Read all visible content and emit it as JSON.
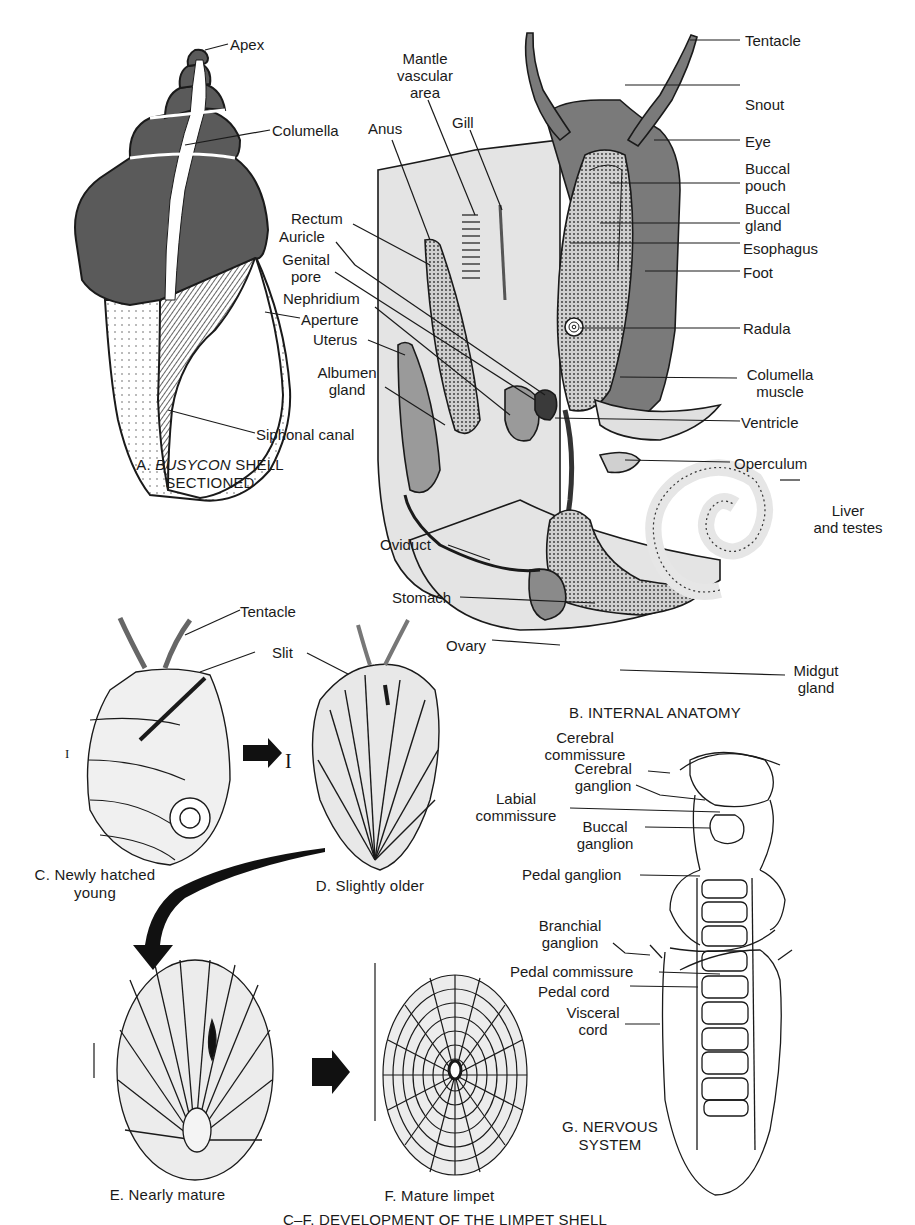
{
  "figure": {
    "colors": {
      "background": "#ffffff",
      "ink": "#1a1a1a",
      "dark_tissue": "#6b6b6b",
      "mid_tissue": "#9a9a9a",
      "light_tissue": "#d8d8d8",
      "mantle": "#e4e4e4"
    },
    "panel_a": {
      "caption_prefix": "A.",
      "caption_italic": "BUSYCON",
      "caption_suffix": "SHELL",
      "caption_line2": "SECTIONED",
      "labels": {
        "apex": "Apex",
        "columella": "Columella",
        "aperture": "Aperture",
        "siphonal_canal": "Siphonal canal"
      }
    },
    "panel_b": {
      "caption": "B. INTERNAL ANATOMY",
      "labels": {
        "mantle_vascular_area_1": "Mantle",
        "mantle_vascular_area_2": "vascular",
        "mantle_vascular_area_3": "area",
        "gill": "Gill",
        "anus": "Anus",
        "rectum": "Rectum",
        "auricle": "Auricle",
        "genital_pore_1": "Genital",
        "genital_pore_2": "pore",
        "nephridium": "Nephridium",
        "uterus": "Uterus",
        "albumen_gland_1": "Albumen",
        "albumen_gland_2": "gland",
        "oviduct": "Oviduct",
        "stomach": "Stomach",
        "ovary": "Ovary",
        "tentacle": "Tentacle",
        "snout": "Snout",
        "eye": "Eye",
        "buccal_pouch_1": "Buccal",
        "buccal_pouch_2": "pouch",
        "buccal_gland_1": "Buccal",
        "buccal_gland_2": "gland",
        "esophagus": "Esophagus",
        "foot": "Foot",
        "radula": "Radula",
        "columella_muscle_1": "Columella",
        "columella_muscle_2": "muscle",
        "ventricle": "Ventricle",
        "operculum": "Operculum",
        "liver_testes_1": "Liver",
        "liver_testes_2": "and testes",
        "midgut_gland_1": "Midgut",
        "midgut_gland_2": "gland"
      }
    },
    "panel_c": {
      "caption_line1": "C. Newly hatched",
      "caption_line2": "young",
      "labels": {
        "tentacle": "Tentacle",
        "slit": "Slit"
      }
    },
    "panel_d": {
      "caption": "D. Slightly older"
    },
    "panel_e": {
      "caption": "E. Nearly mature"
    },
    "panel_f": {
      "caption": "F. Mature limpet"
    },
    "panel_cf": {
      "caption": "C–F. DEVELOPMENT OF THE LIMPET SHELL"
    },
    "panel_g": {
      "caption_line1": "G. NERVOUS",
      "caption_line2": "SYSTEM",
      "labels": {
        "cerebral_commissure_1": "Cerebral",
        "cerebral_commissure_2": "commissure",
        "cerebral_ganglion_1": "Cerebral",
        "cerebral_ganglion_2": "ganglion",
        "labial_commissure_1": "Labial",
        "labial_commissure_2": "commissure",
        "buccal_ganglion_1": "Buccal",
        "buccal_ganglion_2": "ganglion",
        "pedal_ganglion": "Pedal ganglion",
        "branchial_ganglion_1": "Branchial",
        "branchial_ganglion_2": "ganglion",
        "pedal_commissure": "Pedal commissure",
        "pedal_cord": "Pedal cord",
        "visceral_cord_1": "Visceral",
        "visceral_cord_2": "cord"
      }
    }
  }
}
